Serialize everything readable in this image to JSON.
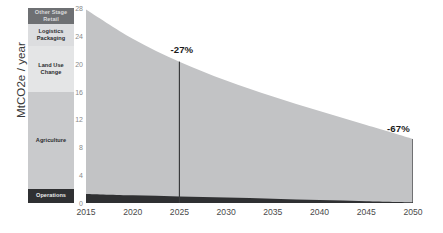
{
  "chart_data": {
    "type": "area",
    "title": "",
    "xlabel": "",
    "ylabel": "MtCO2e / year",
    "xlim": [
      2015,
      2050
    ],
    "ylim": [
      0,
      28
    ],
    "grid": false,
    "legend_position": "left-stacked-bar",
    "x_ticks": [
      "2015",
      "2020",
      "2025",
      "2030",
      "2035",
      "2040",
      "2045",
      "2050"
    ],
    "x_tick_values": [
      2015,
      2020,
      2025,
      2030,
      2035,
      2040,
      2045,
      2050
    ],
    "y_ticks": [
      "0",
      "4",
      "8",
      "12",
      "16",
      "20",
      "24",
      "28"
    ],
    "y_tick_values": [
      0,
      4,
      8,
      12,
      16,
      20,
      24,
      28
    ],
    "x": [
      2015,
      2020,
      2025,
      2030,
      2035,
      2040,
      2045,
      2050
    ],
    "series": [
      {
        "name": "Operations",
        "color": "#2f3032",
        "values": [
          1.3,
          1.1,
          0.95,
          0.78,
          0.6,
          0.42,
          0.26,
          0.1
        ]
      },
      {
        "name": "Total footprint",
        "color": "#c2c3c5",
        "values": [
          27.8,
          23.6,
          20.3,
          17.6,
          15.3,
          13.2,
          11.2,
          9.2
        ]
      }
    ],
    "annotations": [
      {
        "label": "-27%",
        "x": 2025,
        "value": 20.3
      },
      {
        "label": "-67%",
        "x": 2050,
        "value": 9.2
      }
    ],
    "marker_lines": [
      2025,
      2050
    ],
    "composition_bar": {
      "title": "",
      "total": 27.8,
      "segments": [
        {
          "label": "Other Stage\nRetail",
          "label_lines": [
            "Other Stage",
            "Retail"
          ],
          "color": "#6e7073",
          "text_color": "#d8d9da",
          "share_pct": 8.2
        },
        {
          "label": "Logistics\nPackaging",
          "label_lines": [
            "Logistics",
            "Packaging"
          ],
          "color": "#dcdddf",
          "text_color": "#2b2c2e",
          "share_pct": 11.3
        },
        {
          "label": "Land Use\nChange",
          "label_lines": [
            "Land Use",
            "Change"
          ],
          "color": "#e4e5e6",
          "text_color": "#2b2c2e",
          "share_pct": 23.6
        },
        {
          "label": "Agriculture",
          "label_lines": [
            "Agriculture"
          ],
          "color": "#c9cacc",
          "text_color": "#2b2c2e",
          "share_pct": 49.7
        },
        {
          "label": "Operations",
          "label_lines": [
            "Operations"
          ],
          "color": "#2f3032",
          "text_color": "#e8e9ea",
          "share_pct": 7.2
        }
      ]
    },
    "colors": {
      "area_fill": "#c2c3c5",
      "operations_fill": "#2f3032",
      "marker_line": "#3a3b3d",
      "axis_text": "#4a4a4a",
      "y_tick_text": "#8a8a8a",
      "annotation_text": "#1a1a1a",
      "background": "#ffffff"
    }
  }
}
